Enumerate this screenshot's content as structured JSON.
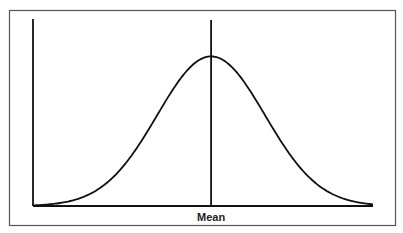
{
  "chart_data": {
    "type": "line",
    "title": "",
    "xlabel": "",
    "ylabel": "",
    "distribution": "normal",
    "mean": 0,
    "std": 1,
    "xlim": [
      -3.3,
      3.0
    ],
    "ylim": [
      0,
      1.25
    ],
    "peak_value": 1.0,
    "annotations": [
      {
        "text": "Mean",
        "x": 0
      }
    ],
    "tick_labels": [
      "Mean"
    ],
    "grid": false,
    "legend": "none"
  },
  "colors": {
    "line": "#111111",
    "frame": "#555555",
    "background": "#ffffff"
  }
}
